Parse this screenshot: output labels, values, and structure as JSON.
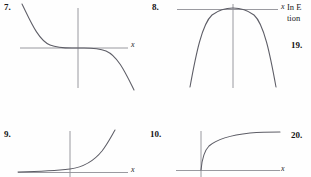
{
  "page": {
    "width": 311,
    "height": 177,
    "background": "#fefefe",
    "axis_color": "#8e8e95",
    "curve_color": "#5d5d66",
    "text_color": "#151515"
  },
  "figures": [
    {
      "number": "7.",
      "axis_label": "x",
      "curve_type": "decreasing-cubic",
      "description": "Odd-symmetric decreasing curve falling from upper left through origin to lower right",
      "path": "M 6,2 C 14,18 22,38 34,43 C 44,47 56,46 62,46 C 68,46 80,45 90,49 C 102,54 110,72 118,88"
    },
    {
      "number": "8.",
      "axis_label": "x",
      "curve_type": "even-negative-quartic",
      "description": "Even symmetric curve with flat maximum touching the x-axis, falling steeply on both sides",
      "path": "M 20,85 C 26,52 32,22 42,13 C 50,7 56,6 63,6 C 70,6 76,7 84,13 C 94,22 100,52 106,85"
    },
    {
      "number": "9.",
      "axis_label": "x",
      "curve_type": "exponential-growth",
      "description": "Exponential growth curve asymptotic to the x-axis on the left, rising steeply on the right",
      "path": "M 2,43 C 20,42.6 38,42 54,40 C 68,38 78,32 86,22 C 92,14 96,6 99,1"
    },
    {
      "number": "10.",
      "axis_label": "x",
      "curve_type": "logarithmic",
      "description": "Logarithmic curve rising steeply just right of the y-axis then flattening out",
      "path": "M 31,41 C 32,30 34,22 39,17 C 47,10 62,6 80,4 C 92,3 102,3 110,3"
    }
  ],
  "side_column": {
    "paragraph_lines": [
      "In E",
      "tion"
    ],
    "numbers": [
      "19.",
      "20."
    ]
  }
}
